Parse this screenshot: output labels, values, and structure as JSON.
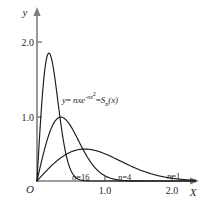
{
  "figure": {
    "background_color": "#ffffff",
    "curve_color": "#1a1a1a",
    "axis_color": "#7d7d7d"
  },
  "axes": {
    "y_label": "y",
    "x_label": "X",
    "origin_label": "O",
    "y_ticks": [
      {
        "label": "2.0",
        "value": 2.0
      },
      {
        "label": "1.0",
        "value": 1.0
      }
    ],
    "x_ticks": [
      {
        "label": "1.0",
        "value": 1.0
      },
      {
        "label": "2.0",
        "value": 2.0
      }
    ]
  },
  "annotations": {
    "formula": {
      "lhs": "y",
      "equals1": "=",
      "coef": "nxe",
      "exponent": "-nx",
      "exponent_sup": "2",
      "equals2": "=",
      "func": "S",
      "func_sub": "n",
      "arg": "(x)",
      "plain_text": "y = nxe^(-nx^2) = S_n(x)"
    },
    "curve_labels": [
      {
        "prefix": "n",
        "eq": "=16",
        "plain_text": "n=16"
      },
      {
        "prefix": "n",
        "eq": "=4",
        "plain_text": "n=4"
      },
      {
        "prefix": "n",
        "eq": "=1",
        "plain_text": "n=1"
      }
    ]
  },
  "chart_data": {
    "type": "line",
    "xlabel": "X",
    "ylabel": "y",
    "xlim": [
      0,
      2.35
    ],
    "ylim": [
      0,
      2.35
    ],
    "grid": false,
    "legend": "inline-curve-labels",
    "function": "y = n*x*exp(-n*x^2)",
    "series": [
      {
        "name": "n=16",
        "n": 16,
        "peak_x": 0.1768,
        "peak_y": 1.7155,
        "label_position": {
          "x": 0.52,
          "y": 0.1
        },
        "x": [
          0,
          0.02,
          0.04,
          0.06,
          0.08,
          0.1,
          0.125,
          0.15,
          0.1768,
          0.2,
          0.225,
          0.25,
          0.275,
          0.3,
          0.325,
          0.35,
          0.4,
          0.45,
          0.5,
          0.55,
          0.6,
          0.7,
          0.8,
          0.9,
          1.0
        ],
        "y": [
          0,
          0.3179,
          0.6277,
          0.922,
          1.1941,
          1.4382,
          1.6932,
          1.8657,
          1.7155,
          1.6492,
          1.4432,
          1.1994,
          0.9499,
          0.7196,
          0.5245,
          0.369,
          0.1572,
          0.0583,
          0.0191,
          0.0056,
          0.0015,
          0.0001,
          0.0,
          0.0,
          0.0
        ]
      },
      {
        "name": "n=4",
        "n": 4,
        "peak_x": 0.3536,
        "peak_y": 0.8578,
        "label_position": {
          "x": 1.52,
          "y": 0.1
        },
        "x": [
          0,
          0.05,
          0.1,
          0.15,
          0.2,
          0.25,
          0.3,
          0.3536,
          0.4,
          0.45,
          0.5,
          0.55,
          0.6,
          0.65,
          0.7,
          0.75,
          0.8,
          0.9,
          1.0,
          1.1,
          1.2,
          1.3,
          1.4
        ],
        "y": [
          0,
          0.198,
          0.3843,
          0.547,
          0.6776,
          0.771,
          0.8258,
          0.8578,
          0.8455,
          0.7999,
          0.7358,
          0.6596,
          0.578,
          0.4964,
          0.4184,
          0.3463,
          0.2815,
          0.1766,
          0.1048,
          0.0591,
          0.0318,
          0.0164,
          0.0081
        ]
      },
      {
        "name": "n=1",
        "n": 1,
        "peak_x": 0.7071,
        "peak_y": 0.4289,
        "label_position": {
          "x": 2.08,
          "y": 0.1
        },
        "x": [
          0,
          0.1,
          0.2,
          0.3,
          0.4,
          0.5,
          0.6,
          0.7071,
          0.8,
          0.9,
          1.0,
          1.1,
          1.2,
          1.3,
          1.4,
          1.5,
          1.6,
          1.7,
          1.8,
          1.9,
          2.0,
          2.1,
          2.2,
          2.3
        ],
        "y": [
          0,
          0.099,
          0.1922,
          0.2742,
          0.3409,
          0.3894,
          0.4189,
          0.4289,
          0.4216,
          0.3995,
          0.3679,
          0.3255,
          0.2842,
          0.2405,
          0.1979,
          0.1581,
          0.1227,
          0.0926,
          0.068,
          0.0486,
          0.0366,
          0.0256,
          0.0174,
          0.0115
        ]
      }
    ]
  }
}
